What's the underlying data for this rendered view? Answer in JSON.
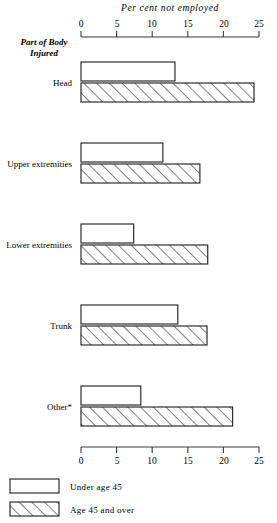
{
  "chart_data": {
    "type": "bar",
    "orientation": "horizontal",
    "title": "Per cent not employed",
    "xlabel": "Per cent not employed",
    "ylabel": "Part of Body Injured",
    "xlim": [
      0,
      25
    ],
    "xticks": [
      0,
      5,
      10,
      15,
      20,
      25
    ],
    "xticklabels": [
      "0",
      "5",
      "10",
      "15",
      "20",
      "25"
    ],
    "grid": false,
    "legend_position": "bottom-left",
    "categories": [
      "Head",
      "Upper extremities",
      "Lower extremities",
      "Trunk",
      "Other*"
    ],
    "series": [
      {
        "name": "Under age 45",
        "fill": "white",
        "values": [
          13.2,
          11.5,
          7.4,
          13.6,
          8.4
        ]
      },
      {
        "name": "Age 45 and over",
        "fill": "hatched",
        "values": [
          24.3,
          16.7,
          17.8,
          17.7,
          21.3
        ]
      }
    ]
  },
  "axis": {
    "top_title": "Per cent not employed",
    "group_label_line1": "Part of Body",
    "group_label_line2": "Injured",
    "tick_values": [
      "0",
      "5",
      "10",
      "15",
      "20",
      "25"
    ]
  },
  "categories": [
    {
      "label": "Head"
    },
    {
      "label": "Upper extremities"
    },
    {
      "label": "Lower extremities"
    },
    {
      "label": "Trunk"
    },
    {
      "label": "Other*"
    }
  ],
  "legend": {
    "items": [
      {
        "label": "Under age 45",
        "swatch": "white-swatch"
      },
      {
        "label": "Age 45 and over",
        "swatch": "hatched-swatch"
      }
    ]
  },
  "colors": {
    "ink": "#111111",
    "axis": "#3a3a3a",
    "bar_stroke": "#1a1a1a",
    "bar_fill": "#ffffff"
  }
}
